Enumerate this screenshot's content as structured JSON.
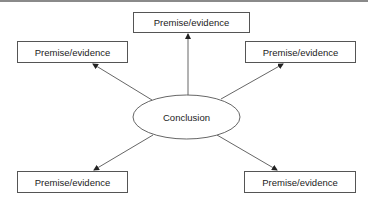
{
  "diagram": {
    "center": {
      "label": "Conclusion",
      "shape": "ellipse"
    },
    "nodes": [
      {
        "id": "top",
        "label": "Premise/evidence"
      },
      {
        "id": "upper-left",
        "label": "Premise/evidence"
      },
      {
        "id": "upper-right",
        "label": "Premise/evidence"
      },
      {
        "id": "lower-left",
        "label": "Premise/evidence"
      },
      {
        "id": "lower-right",
        "label": "Premise/evidence"
      }
    ],
    "edges": [
      {
        "from": "Conclusion",
        "to": "top"
      },
      {
        "from": "Conclusion",
        "to": "upper-left"
      },
      {
        "from": "Conclusion",
        "to": "upper-right"
      },
      {
        "from": "Conclusion",
        "to": "lower-left"
      },
      {
        "from": "Conclusion",
        "to": "lower-right"
      }
    ],
    "colors": {
      "stroke": "#555555",
      "text": "#222222",
      "background": "#ffffff"
    }
  }
}
